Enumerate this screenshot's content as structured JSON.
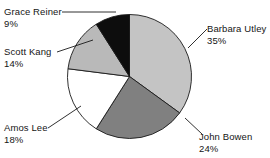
{
  "chart_data": {
    "type": "pie",
    "title": "",
    "categories": [
      "Barbara Utley",
      "John Bowen",
      "Amos Lee",
      "Scott Kang",
      "Grace Reiner"
    ],
    "values": [
      35,
      24,
      18,
      14,
      9
    ],
    "value_suffix": "%",
    "legend": "none",
    "grid": false,
    "start_angle_deg": 0,
    "direction": "clockwise",
    "slices": [
      {
        "label": "Barbara Utley",
        "value": 35,
        "value_text": "35%",
        "color": "#c4c4c4",
        "start_deg": 0,
        "end_deg": 126
      },
      {
        "label": "John Bowen",
        "value": 24,
        "value_text": "24%",
        "color": "#808080",
        "start_deg": 126,
        "end_deg": 212.4
      },
      {
        "label": "Amos Lee",
        "value": 18,
        "value_text": "18%",
        "color": "#ffffff",
        "start_deg": 212.4,
        "end_deg": 277.2
      },
      {
        "label": "Scott Kang",
        "value": 14,
        "value_text": "14%",
        "color": "#b9b9b9",
        "start_deg": 277.2,
        "end_deg": 327.6
      },
      {
        "label": "Grace Reiner",
        "value": 9,
        "value_text": "9%",
        "color": "#0d0d0d",
        "start_deg": 327.6,
        "end_deg": 360
      }
    ]
  },
  "labels": {
    "grace_reiner": {
      "name": "Grace Reiner",
      "pct": "9%"
    },
    "scott_kang": {
      "name": "Scott Kang",
      "pct": "14%"
    },
    "amos_lee": {
      "name": "Amos Lee",
      "pct": "18%"
    },
    "barbara_utley": {
      "name": "Barbara Utley",
      "pct": "35%"
    },
    "john_bowen": {
      "name": "John Bowen",
      "pct": "24%"
    }
  },
  "colors": {
    "outline": "#1a1a1a",
    "background": "#ffffff",
    "text": "#151515"
  }
}
